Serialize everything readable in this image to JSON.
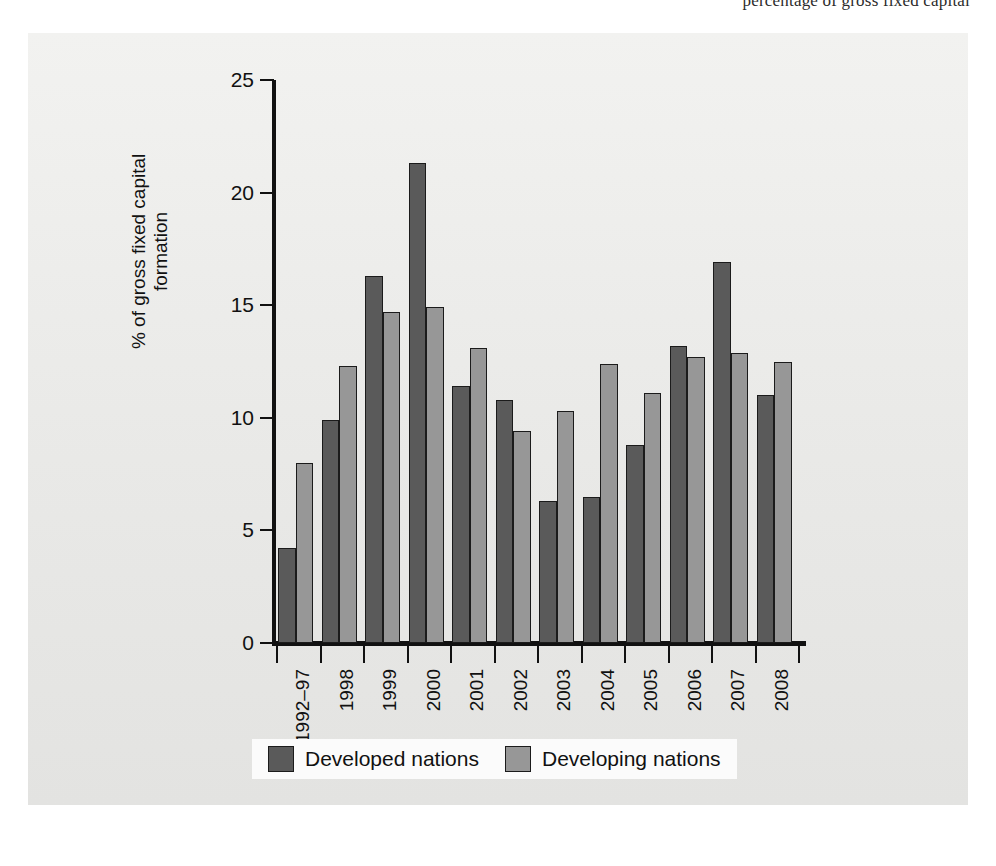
{
  "page": {
    "top_running_text": "percentage of gross fixed capital"
  },
  "legend": {
    "items": [
      {
        "label": "Developed nations",
        "swatch": "dark-gray-swatch",
        "color": "#5a5a5a"
      },
      {
        "label": "Developing nations",
        "swatch": "light-gray-swatch",
        "color": "#979797"
      }
    ]
  },
  "axes": {
    "y_title_line1": "% of gross fixed capital",
    "y_title_line2": "formation",
    "y_ticks": [
      "0",
      "5",
      "10",
      "15",
      "20",
      "25"
    ]
  },
  "chart_data": {
    "type": "bar",
    "title": "",
    "subtitle": "",
    "xlabel": "",
    "ylabel": "% of gross fixed capital formation",
    "ylim": [
      0,
      25
    ],
    "ytick_values": [
      0,
      5,
      10,
      15,
      20,
      25
    ],
    "grid": false,
    "legend_position": "bottom",
    "categories": [
      "1992–97",
      "1998",
      "1999",
      "2000",
      "2001",
      "2002",
      "2003",
      "2004",
      "2005",
      "2006",
      "2007",
      "2008"
    ],
    "series": [
      {
        "name": "Developed nations",
        "color": "#5a5a5a",
        "values": [
          4.2,
          9.9,
          16.3,
          21.3,
          11.4,
          10.8,
          6.3,
          6.5,
          8.8,
          13.2,
          16.9,
          11.0
        ]
      },
      {
        "name": "Developing nations",
        "color": "#979797",
        "values": [
          8.0,
          12.3,
          14.7,
          14.9,
          13.1,
          9.4,
          10.3,
          12.4,
          11.1,
          12.7,
          12.9,
          12.5
        ]
      }
    ]
  },
  "colors": {
    "panel_background": "#ebebeb",
    "page_background": "#ffffff",
    "axis": "#111111",
    "developed": "#5a5a5a",
    "developing": "#979797"
  }
}
